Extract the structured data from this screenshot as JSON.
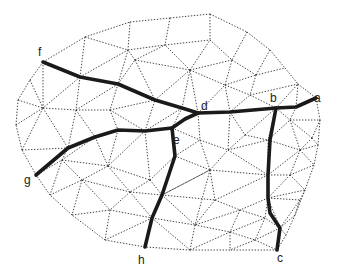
{
  "diagram": {
    "type": "triangulated-mesh-with-paths",
    "nodes": [
      {
        "id": "a",
        "label": "a",
        "x": 316,
        "y": 98,
        "lx": 314,
        "ly": 102
      },
      {
        "id": "b",
        "label": "b",
        "x": 276,
        "y": 108,
        "lx": 270,
        "ly": 102
      },
      {
        "id": "c",
        "label": "c",
        "x": 277,
        "y": 250,
        "lx": 277,
        "ly": 262
      },
      {
        "id": "d",
        "label": "d",
        "x": 198,
        "y": 113,
        "lx": 201,
        "ly": 110
      },
      {
        "id": "e",
        "label": "e",
        "x": 172,
        "y": 128,
        "lx": 173,
        "ly": 144
      },
      {
        "id": "f",
        "label": "f",
        "x": 43,
        "y": 62,
        "lx": 38,
        "ly": 56
      },
      {
        "id": "g",
        "label": "g",
        "x": 36,
        "y": 175,
        "lx": 24,
        "ly": 184
      },
      {
        "id": "h",
        "label": "h",
        "x": 145,
        "y": 247,
        "lx": 138,
        "ly": 264
      }
    ],
    "paths": [
      {
        "name": "path-f-d",
        "points": [
          [
            43,
            62
          ],
          [
            80,
            77
          ],
          [
            118,
            84
          ],
          [
            155,
            100
          ],
          [
            182,
            108
          ],
          [
            198,
            113
          ]
        ]
      },
      {
        "name": "path-d-a",
        "points": [
          [
            198,
            113
          ],
          [
            230,
            112
          ],
          [
            276,
            108
          ],
          [
            296,
            107
          ],
          [
            316,
            98
          ]
        ]
      },
      {
        "name": "path-d-e",
        "points": [
          [
            198,
            113
          ],
          [
            185,
            119
          ],
          [
            172,
            128
          ]
        ]
      },
      {
        "name": "path-e-g",
        "points": [
          [
            172,
            128
          ],
          [
            145,
            131
          ],
          [
            118,
            130
          ],
          [
            95,
            137
          ],
          [
            68,
            148
          ],
          [
            36,
            175
          ]
        ]
      },
      {
        "name": "path-e-h",
        "points": [
          [
            172,
            128
          ],
          [
            175,
            156
          ],
          [
            162,
            195
          ],
          [
            152,
            218
          ],
          [
            145,
            247
          ]
        ]
      },
      {
        "name": "path-b-c",
        "points": [
          [
            276,
            108
          ],
          [
            270,
            140
          ],
          [
            268,
            175
          ],
          [
            268,
            198
          ],
          [
            270,
            213
          ],
          [
            280,
            228
          ],
          [
            277,
            250
          ]
        ]
      }
    ],
    "mesh_vertices": [
      [
        130,
        22
      ],
      [
        170,
        18
      ],
      [
        210,
        14
      ],
      [
        247,
        32
      ],
      [
        270,
        50
      ],
      [
        285,
        68
      ],
      [
        298,
        84
      ],
      [
        316,
        98
      ],
      [
        320,
        120
      ],
      [
        318,
        145
      ],
      [
        314,
        165
      ],
      [
        305,
        190
      ],
      [
        295,
        215
      ],
      [
        286,
        235
      ],
      [
        277,
        250
      ],
      [
        230,
        250
      ],
      [
        190,
        250
      ],
      [
        145,
        247
      ],
      [
        105,
        240
      ],
      [
        72,
        215
      ],
      [
        50,
        195
      ],
      [
        36,
        175
      ],
      [
        22,
        150
      ],
      [
        16,
        125
      ],
      [
        18,
        100
      ],
      [
        30,
        80
      ],
      [
        43,
        62
      ],
      [
        85,
        37
      ],
      [
        128,
        50
      ],
      [
        165,
        45
      ],
      [
        210,
        40
      ],
      [
        232,
        60
      ],
      [
        256,
        75
      ],
      [
        80,
        77
      ],
      [
        118,
        84
      ],
      [
        155,
        100
      ],
      [
        182,
        108
      ],
      [
        198,
        113
      ],
      [
        230,
        112
      ],
      [
        250,
        95
      ],
      [
        276,
        108
      ],
      [
        296,
        107
      ],
      [
        43,
        108
      ],
      [
        76,
        110
      ],
      [
        110,
        110
      ],
      [
        145,
        131
      ],
      [
        118,
        130
      ],
      [
        95,
        137
      ],
      [
        68,
        148
      ],
      [
        172,
        128
      ],
      [
        62,
        160
      ],
      [
        82,
        180
      ],
      [
        108,
        166
      ],
      [
        130,
        192
      ],
      [
        150,
        180
      ],
      [
        175,
        156
      ],
      [
        162,
        195
      ],
      [
        152,
        218
      ],
      [
        110,
        210
      ],
      [
        200,
        140
      ],
      [
        210,
        170
      ],
      [
        228,
        150
      ],
      [
        245,
        135
      ],
      [
        268,
        140
      ],
      [
        290,
        120
      ],
      [
        300,
        150
      ],
      [
        312,
        138
      ],
      [
        268,
        175
      ],
      [
        290,
        175
      ],
      [
        268,
        198
      ],
      [
        300,
        200
      ],
      [
        280,
        228
      ],
      [
        240,
        210
      ],
      [
        215,
        200
      ],
      [
        195,
        225
      ],
      [
        230,
        232
      ],
      [
        255,
        240
      ],
      [
        265,
        218
      ],
      [
        135,
        60
      ],
      [
        190,
        70
      ],
      [
        225,
        85
      ]
    ],
    "mesh_edges": [
      [
        0,
        1
      ],
      [
        1,
        2
      ],
      [
        2,
        3
      ],
      [
        3,
        4
      ],
      [
        4,
        5
      ],
      [
        5,
        6
      ],
      [
        6,
        7
      ],
      [
        7,
        8
      ],
      [
        8,
        9
      ],
      [
        9,
        10
      ],
      [
        10,
        11
      ],
      [
        11,
        12
      ],
      [
        12,
        13
      ],
      [
        13,
        14
      ],
      [
        14,
        15
      ],
      [
        15,
        16
      ],
      [
        16,
        17
      ],
      [
        17,
        18
      ],
      [
        18,
        19
      ],
      [
        19,
        20
      ],
      [
        20,
        21
      ],
      [
        21,
        22
      ],
      [
        22,
        23
      ],
      [
        23,
        24
      ],
      [
        24,
        25
      ],
      [
        25,
        26
      ],
      [
        26,
        27
      ],
      [
        27,
        0
      ],
      [
        27,
        28
      ],
      [
        0,
        28
      ],
      [
        28,
        29
      ],
      [
        1,
        29
      ],
      [
        29,
        30
      ],
      [
        2,
        30
      ],
      [
        30,
        31
      ],
      [
        3,
        31
      ],
      [
        31,
        32
      ],
      [
        4,
        32
      ],
      [
        32,
        5
      ],
      [
        32,
        39
      ],
      [
        39,
        6
      ],
      [
        39,
        40
      ],
      [
        40,
        6
      ],
      [
        26,
        33
      ],
      [
        27,
        33
      ],
      [
        33,
        28
      ],
      [
        33,
        34
      ],
      [
        28,
        34
      ],
      [
        34,
        78
      ],
      [
        78,
        28
      ],
      [
        78,
        29
      ],
      [
        78,
        79
      ],
      [
        79,
        29
      ],
      [
        79,
        30
      ],
      [
        79,
        31
      ],
      [
        79,
        80
      ],
      [
        80,
        31
      ],
      [
        80,
        32
      ],
      [
        80,
        39
      ],
      [
        34,
        35
      ],
      [
        78,
        35
      ],
      [
        35,
        79
      ],
      [
        35,
        36
      ],
      [
        36,
        79
      ],
      [
        36,
        37
      ],
      [
        37,
        79
      ],
      [
        37,
        80
      ],
      [
        37,
        38
      ],
      [
        38,
        80
      ],
      [
        38,
        39
      ],
      [
        38,
        40
      ],
      [
        40,
        41
      ],
      [
        41,
        7
      ],
      [
        41,
        6
      ],
      [
        25,
        42
      ],
      [
        26,
        42
      ],
      [
        33,
        42
      ],
      [
        42,
        43
      ],
      [
        33,
        43
      ],
      [
        43,
        34
      ],
      [
        43,
        44
      ],
      [
        34,
        44
      ],
      [
        44,
        35
      ],
      [
        44,
        46
      ],
      [
        44,
        45
      ],
      [
        45,
        35
      ],
      [
        45,
        36
      ],
      [
        45,
        49
      ],
      [
        49,
        36
      ],
      [
        49,
        37
      ],
      [
        24,
        42
      ],
      [
        23,
        42
      ],
      [
        22,
        42
      ],
      [
        42,
        48
      ],
      [
        43,
        48
      ],
      [
        43,
        47
      ],
      [
        47,
        46
      ],
      [
        46,
        45
      ],
      [
        47,
        48
      ],
      [
        22,
        48
      ],
      [
        21,
        48
      ],
      [
        48,
        50
      ],
      [
        21,
        50
      ],
      [
        50,
        20
      ],
      [
        50,
        51
      ],
      [
        20,
        51
      ],
      [
        47,
        50
      ],
      [
        47,
        52
      ],
      [
        52,
        50
      ],
      [
        52,
        51
      ],
      [
        46,
        52
      ],
      [
        45,
        52
      ],
      [
        45,
        54
      ],
      [
        52,
        54
      ],
      [
        54,
        55
      ],
      [
        49,
        55
      ],
      [
        49,
        59
      ],
      [
        37,
        59
      ],
      [
        55,
        59
      ],
      [
        52,
        53
      ],
      [
        51,
        53
      ],
      [
        54,
        53
      ],
      [
        53,
        56
      ],
      [
        54,
        56
      ],
      [
        55,
        56
      ],
      [
        51,
        19
      ],
      [
        51,
        58
      ],
      [
        19,
        58
      ],
      [
        53,
        58
      ],
      [
        58,
        18
      ],
      [
        58,
        57
      ],
      [
        53,
        57
      ],
      [
        56,
        57
      ],
      [
        57,
        18
      ],
      [
        57,
        17
      ],
      [
        56,
        60
      ],
      [
        55,
        60
      ],
      [
        59,
        60
      ],
      [
        59,
        61
      ],
      [
        38,
        61
      ],
      [
        38,
        62
      ],
      [
        61,
        62
      ],
      [
        62,
        40
      ],
      [
        62,
        63
      ],
      [
        40,
        63
      ],
      [
        40,
        64
      ],
      [
        41,
        64
      ],
      [
        64,
        8
      ],
      [
        64,
        66
      ],
      [
        8,
        66
      ],
      [
        66,
        9
      ],
      [
        64,
        65
      ],
      [
        66,
        65
      ],
      [
        65,
        9
      ],
      [
        65,
        10
      ],
      [
        63,
        64
      ],
      [
        63,
        65
      ],
      [
        63,
        67
      ],
      [
        65,
        67
      ],
      [
        65,
        68
      ],
      [
        67,
        68
      ],
      [
        68,
        10
      ],
      [
        68,
        11
      ],
      [
        60,
        61
      ],
      [
        61,
        63
      ],
      [
        60,
        67
      ],
      [
        61,
        67
      ],
      [
        60,
        73
      ],
      [
        67,
        73
      ],
      [
        67,
        69
      ],
      [
        68,
        69
      ],
      [
        69,
        11
      ],
      [
        69,
        70
      ],
      [
        11,
        70
      ],
      [
        70,
        12
      ],
      [
        69,
        71
      ],
      [
        70,
        71
      ],
      [
        71,
        12
      ],
      [
        71,
        13
      ],
      [
        71,
        14
      ],
      [
        73,
        72
      ],
      [
        69,
        72
      ],
      [
        69,
        77
      ],
      [
        72,
        77
      ],
      [
        71,
        77
      ],
      [
        77,
        76
      ],
      [
        71,
        76
      ],
      [
        76,
        14
      ],
      [
        76,
        15
      ],
      [
        72,
        75
      ],
      [
        77,
        75
      ],
      [
        75,
        76
      ],
      [
        75,
        15
      ],
      [
        73,
        74
      ],
      [
        72,
        74
      ],
      [
        74,
        75
      ],
      [
        74,
        16
      ],
      [
        75,
        16
      ],
      [
        56,
        74
      ],
      [
        60,
        74
      ],
      [
        57,
        74
      ],
      [
        57,
        16
      ],
      [
        56,
        73
      ],
      [
        60,
        56
      ]
    ]
  },
  "colors": {
    "mesh": "#333333",
    "path": "#1a1a1a",
    "label": "#222222",
    "background": "#ffffff"
  }
}
